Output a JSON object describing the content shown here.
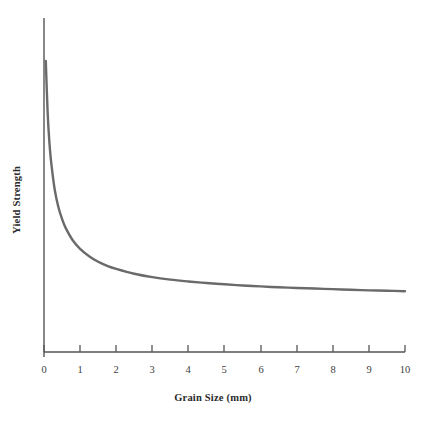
{
  "chart_data": {
    "type": "line",
    "title": "",
    "xlabel": "Grain Size (mm)",
    "ylabel": "Yield Strength",
    "xlim": [
      0,
      10
    ],
    "ylim": [
      0,
      1
    ],
    "grid": false,
    "legend": null,
    "xticks": [
      "0",
      "1",
      "2",
      "3",
      "4",
      "5",
      "6",
      "7",
      "8",
      "9",
      "10"
    ],
    "xtick_values": [
      0,
      1,
      2,
      3,
      4,
      5,
      6,
      7,
      8,
      9,
      10
    ],
    "yticks": [],
    "series": [
      {
        "name": "Yield Strength",
        "color": "#6a6a6a",
        "x": [
          0.05,
          0.1,
          0.15,
          0.2,
          0.3,
          0.4,
          0.5,
          0.6,
          0.8,
          1.0,
          1.25,
          1.5,
          1.75,
          2.0,
          2.5,
          3.0,
          3.5,
          4.0,
          4.5,
          5.0,
          5.5,
          6.0,
          6.5,
          7.0,
          7.5,
          8.0,
          8.5,
          9.0,
          9.5,
          10.0
        ],
        "y": [
          0.945,
          0.78,
          0.68,
          0.615,
          0.525,
          0.47,
          0.432,
          0.403,
          0.362,
          0.335,
          0.311,
          0.293,
          0.28,
          0.27,
          0.254,
          0.243,
          0.235,
          0.229,
          0.224,
          0.22,
          0.216,
          0.213,
          0.21,
          0.208,
          0.206,
          0.204,
          0.202,
          0.2,
          0.199,
          0.197
        ]
      }
    ],
    "annotations": []
  },
  "axes": {
    "axis_color": "#555555",
    "curve_color": "#6a6a6a",
    "background": "#ffffff"
  }
}
